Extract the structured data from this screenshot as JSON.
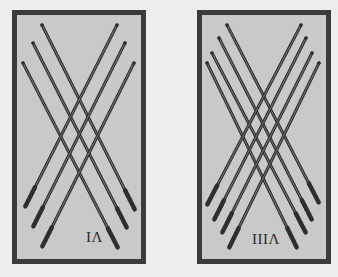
{
  "cards": [
    {
      "id": "left",
      "numeral": "IΛ",
      "rod_count": 6,
      "box": {
        "x": 12,
        "y": 10,
        "w": 134,
        "h": 254
      },
      "numeral_pos": {
        "x": 86,
        "y": 230
      },
      "rods": [
        {
          "x1": 42,
          "y1": 25,
          "x2": 135,
          "y2": 210
        },
        {
          "x1": 33,
          "y1": 43,
          "x2": 127,
          "y2": 228
        },
        {
          "x1": 23,
          "y1": 63,
          "x2": 118,
          "y2": 248
        },
        {
          "x1": 117,
          "y1": 25,
          "x2": 25,
          "y2": 207
        },
        {
          "x1": 125,
          "y1": 43,
          "x2": 33,
          "y2": 227
        },
        {
          "x1": 134,
          "y1": 63,
          "x2": 42,
          "y2": 247
        }
      ]
    },
    {
      "id": "right",
      "numeral": "IIIΛ",
      "rod_count": 8,
      "box": {
        "x": 197,
        "y": 10,
        "w": 134,
        "h": 254
      },
      "numeral_pos": {
        "x": 252,
        "y": 232
      },
      "rods": [
        {
          "x1": 227,
          "y1": 25,
          "x2": 319,
          "y2": 203
        },
        {
          "x1": 219,
          "y1": 38,
          "x2": 312,
          "y2": 220
        },
        {
          "x1": 212,
          "y1": 53,
          "x2": 306,
          "y2": 233
        },
        {
          "x1": 207,
          "y1": 63,
          "x2": 297,
          "y2": 248
        },
        {
          "x1": 301,
          "y1": 25,
          "x2": 207,
          "y2": 205
        },
        {
          "x1": 306,
          "y1": 38,
          "x2": 214,
          "y2": 220
        },
        {
          "x1": 312,
          "y1": 53,
          "x2": 222,
          "y2": 233
        },
        {
          "x1": 319,
          "y1": 63,
          "x2": 229,
          "y2": 248
        }
      ]
    }
  ],
  "colors": {
    "background": "#ededeb",
    "card_fill": "#c9c9c7",
    "card_border": "#3b3b3b",
    "rod": "#2e2e2e",
    "rod_highlight": "#8a8a88"
  }
}
